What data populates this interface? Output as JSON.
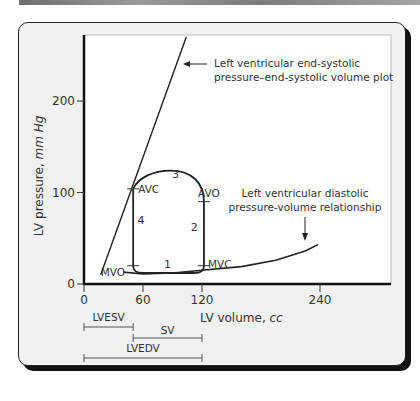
{
  "chart_data": {
    "type": "line",
    "title": "",
    "xlabel": "LV volume, cc",
    "ylabel_main": "LV pressure, ",
    "ylabel_unit": "mm Hg",
    "xlabel_main": "LV volume, ",
    "xlabel_unit": "cc",
    "xlim": [
      0,
      312
    ],
    "ylim": [
      0,
      272
    ],
    "x_ticks": [
      0,
      60,
      120,
      240
    ],
    "x_tick_labels": [
      "0",
      "60",
      "120",
      "240"
    ],
    "y_ticks": [
      0,
      100,
      200
    ],
    "y_tick_labels": [
      "0",
      "100",
      "200"
    ],
    "series": [
      {
        "name": "Left ventricular end-systolic pressure–end-systolic volume plot",
        "points": [
          [
            17,
            10
          ],
          [
            104,
            270
          ]
        ]
      },
      {
        "name": "Left ventricular diastolic pressure-volume relationship",
        "points": [
          [
            40,
            13
          ],
          [
            60,
            11
          ],
          [
            90,
            12
          ],
          [
            120,
            15
          ],
          [
            160,
            19
          ],
          [
            195,
            26
          ],
          [
            225,
            36
          ],
          [
            238,
            43
          ]
        ]
      },
      {
        "name": "Pressure-volume loop",
        "points": [
          [
            50,
            20
          ],
          [
            52,
            14
          ],
          [
            70,
            12
          ],
          [
            95,
            12
          ],
          [
            118,
            14
          ],
          [
            122,
            20
          ],
          [
            122,
            90
          ],
          [
            118,
            108
          ],
          [
            105,
            120
          ],
          [
            88,
            124
          ],
          [
            72,
            122
          ],
          [
            55,
            112
          ],
          [
            50,
            104
          ],
          [
            50,
            20
          ]
        ]
      }
    ],
    "point_labels": [
      {
        "text": "AVC",
        "x": 50,
        "y": 104
      },
      {
        "text": "AVO",
        "x": 122,
        "y": 90
      },
      {
        "text": "MVC",
        "x": 122,
        "y": 20
      },
      {
        "text": "MVO",
        "x": 50,
        "y": 14
      }
    ],
    "phase_labels": [
      {
        "text": "1",
        "x": 85,
        "y": 18
      },
      {
        "text": "2",
        "x": 112,
        "y": 58
      },
      {
        "text": "3",
        "x": 93,
        "y": 116
      },
      {
        "text": "4",
        "x": 58,
        "y": 66
      }
    ],
    "annotations": [
      {
        "lines": [
          "Left ventricular end-systolic",
          "pressure–end-systolic volume plot"
        ]
      },
      {
        "lines": [
          "Left ventricular diastolic",
          "pressure-volume relationship"
        ]
      }
    ],
    "brackets": [
      {
        "label": "LVESV",
        "from": 0,
        "to": 50
      },
      {
        "label": "SV",
        "from": 50,
        "to": 120
      },
      {
        "label": "LVEDV",
        "from": 0,
        "to": 120
      }
    ],
    "grid": false,
    "legend": "none"
  }
}
